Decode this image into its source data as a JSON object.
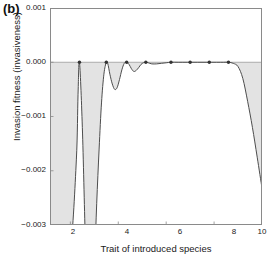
{
  "panel": {
    "label": "(b)"
  },
  "chart_data": {
    "type": "line",
    "title": "",
    "subtitle": "",
    "xlabel": "Trait of introduced species",
    "ylabel": "Invasion fitness (invasiveness)",
    "xlim": [
      1.15,
      10.0
    ],
    "ylim": [
      -0.003,
      0.001
    ],
    "xticks": [
      2,
      4,
      6,
      8,
      10
    ],
    "xtick_labels": [
      "2",
      "4",
      "6",
      "8",
      "10"
    ],
    "yticks": [
      0.001,
      0.0,
      -0.001,
      -0.002,
      -0.003
    ],
    "ytick_labels": [
      "0.001",
      "0.000",
      "−0.001",
      "−0.002",
      "−0.003"
    ],
    "grid": false,
    "legend": "none",
    "zero_line": 0.0,
    "shaded_region_label": "negative invasion fitness (shaded grey)",
    "series": [
      {
        "name": "invasion fitness",
        "color": "#4d4d4d",
        "fill_color": "#e3e3e3",
        "x": [
          1.15,
          1.6,
          2.0,
          2.25,
          2.32,
          2.38,
          2.5,
          2.62,
          2.7,
          2.82,
          2.95,
          3.02,
          3.1,
          3.2,
          3.3,
          3.4,
          3.5,
          3.56,
          3.65,
          3.75,
          3.85,
          3.95,
          4.05,
          4.15,
          4.25,
          4.35,
          4.45,
          4.55,
          4.65,
          4.75,
          4.85,
          4.95,
          5.05,
          5.15,
          5.25,
          5.4,
          5.6,
          5.8,
          6.0,
          6.2,
          6.5,
          6.9,
          7.3,
          7.7,
          8.1,
          8.4,
          8.6,
          8.8,
          9.0,
          9.2,
          9.4,
          9.6,
          9.8,
          10.0
        ],
        "y": [
          -0.0045,
          -0.0042,
          -0.0035,
          -0.0018,
          -0.0006,
          0.0,
          -0.0012,
          -0.0032,
          -0.0042,
          -0.005,
          -0.0044,
          -0.0036,
          -0.0026,
          -0.0016,
          -0.00075,
          -0.00022,
          0.0,
          -2e-05,
          -0.00022,
          -0.0004,
          -0.0005,
          -0.00047,
          -0.00032,
          -0.00014,
          -2e-05,
          0.0,
          -4e-05,
          -0.00012,
          -0.00017,
          -0.00015,
          -0.0001,
          -4e-05,
          -1e-05,
          0.0,
          -1e-05,
          -3e-05,
          -3e-05,
          -2e-05,
          -1e-05,
          0.0,
          0.0,
          0.0,
          0.0,
          0.0,
          0.0,
          0.0,
          0.0,
          -2e-05,
          -8e-05,
          -0.0003,
          -0.00072,
          -0.0012,
          -0.00175,
          -0.00232
        ]
      }
    ],
    "markers": {
      "name": "resident species traits",
      "color": "#333333",
      "x": [
        2.38,
        3.5,
        4.35,
        5.15,
        6.2,
        7.0,
        7.8,
        8.6
      ],
      "y": [
        0.0,
        0.0,
        0.0,
        0.0,
        0.0,
        0.0,
        0.0,
        0.0
      ]
    }
  }
}
